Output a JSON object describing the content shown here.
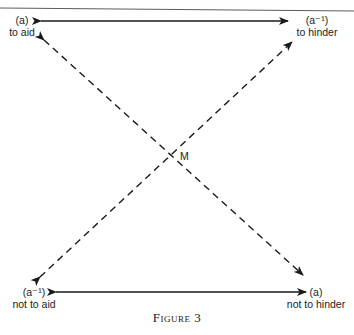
{
  "diagram": {
    "nodes": {
      "top_left": {
        "symbol": "(a)",
        "label": "to aid"
      },
      "top_right": {
        "symbol": "(a⁻¹)",
        "label": "to hinder"
      },
      "bottom_left": {
        "symbol": "(a⁻¹)",
        "label": "not to aid"
      },
      "bottom_right": {
        "symbol": "(a)",
        "label": "not to hinder"
      }
    },
    "center_label": "M",
    "edges": [
      {
        "from": "top_left",
        "to": "top_right",
        "style": "solid",
        "arrows": "both"
      },
      {
        "from": "bottom_left",
        "to": "bottom_right",
        "style": "solid",
        "arrows": "both"
      },
      {
        "from": "bottom_right",
        "to": "top_left",
        "style": "dashed",
        "arrows": "both"
      },
      {
        "from": "bottom_left",
        "to": "top_right",
        "style": "dashed",
        "arrows": "both"
      }
    ],
    "caption": "Figure 3"
  }
}
